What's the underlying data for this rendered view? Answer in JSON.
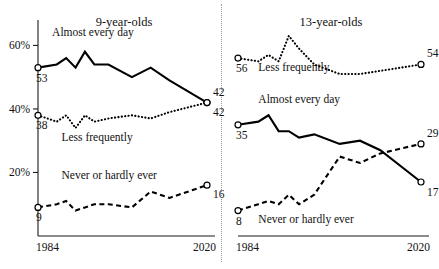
{
  "figure": {
    "background": "#ffffff",
    "ink": "#000000",
    "divider": "dotted-vertical-separator"
  },
  "chart_data": [
    {
      "type": "line",
      "title": "9-year-olds",
      "xlabel": "",
      "ylabel": "",
      "xlim": [
        1984,
        2020
      ],
      "ylim": [
        0,
        68
      ],
      "yticks": [
        20,
        40,
        60
      ],
      "ytick_labels": [
        "20%",
        "40%",
        "60%"
      ],
      "xticks": [
        1984,
        2020
      ],
      "xtick_labels": [
        "1984",
        "2020"
      ],
      "grid": false,
      "legend": "inline-annotations",
      "x": [
        1984,
        1988,
        1990,
        1992,
        1994,
        1996,
        1999,
        2004,
        2008,
        2012,
        2020
      ],
      "series": [
        {
          "name": "Almost every day",
          "style": "solid",
          "label_x": 1987,
          "label_y": 63,
          "start_label": "53",
          "end_label": "42",
          "values": [
            53,
            54,
            56,
            53,
            58,
            54,
            54,
            50,
            53,
            49,
            42
          ]
        },
        {
          "name": "Less frequently",
          "style": "dotted",
          "label_x": 1989,
          "label_y": 30,
          "start_label": "38",
          "end_label": "42",
          "values": [
            38,
            36,
            38,
            34,
            38,
            36,
            37,
            38,
            37,
            39,
            42
          ]
        },
        {
          "name": "Never or hardly ever",
          "style": "dashed",
          "label_x": 1989,
          "label_y": 18,
          "start_label": "9",
          "end_label": "16",
          "values": [
            9,
            10,
            11,
            8,
            9,
            10,
            10,
            9,
            14,
            12,
            16
          ]
        }
      ]
    },
    {
      "type": "line",
      "title": "13-year-olds",
      "xlabel": "",
      "ylabel": "",
      "xlim": [
        1984,
        2020
      ],
      "ylim": [
        0,
        68
      ],
      "yticks": [],
      "ytick_labels": [],
      "xticks": [
        1984,
        2020
      ],
      "xtick_labels": [
        "1984",
        "2020"
      ],
      "grid": false,
      "legend": "inline-annotations",
      "x": [
        1984,
        1988,
        1990,
        1992,
        1994,
        1996,
        1999,
        2004,
        2008,
        2012,
        2020
      ],
      "series": [
        {
          "name": "Less frequently",
          "style": "dotted",
          "label_x": 1988,
          "label_y": 52,
          "start_label": "56",
          "end_label": "54",
          "values": [
            56,
            55,
            57,
            55,
            63,
            59,
            54,
            51,
            51,
            52,
            54
          ]
        },
        {
          "name": "Almost every day",
          "style": "solid",
          "label_x": 1988,
          "label_y": 42,
          "start_label": "35",
          "end_label": "17",
          "values": [
            35,
            36,
            38,
            33,
            33,
            31,
            32,
            29,
            30,
            27,
            17
          ]
        },
        {
          "name": "Never or hardly ever",
          "style": "dashed",
          "label_x": 1988,
          "label_y": 4,
          "start_label": "8",
          "end_label": "29",
          "values": [
            8,
            10,
            11,
            10,
            13,
            10,
            13,
            25,
            23,
            26,
            29
          ]
        }
      ]
    }
  ]
}
